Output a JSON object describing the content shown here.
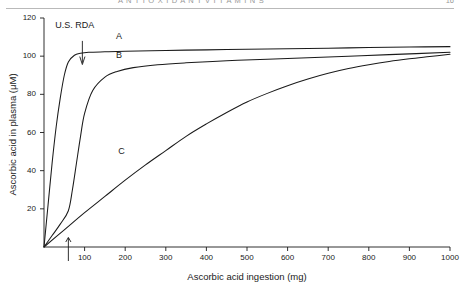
{
  "page": {
    "running_head": "A N T I O X I D A N T   V I T A M I N S",
    "folio": "16"
  },
  "figure": {
    "annotation_rda": "U.S. RDA",
    "curve_label_a": "A",
    "curve_label_b": "B",
    "curve_label_c": "C",
    "rda_arrow_top_icon": "down-arrow-icon",
    "rda_arrow_bottom_icon": "up-arrow-icon",
    "ink_color": "#1a1a1a"
  },
  "chart_data": {
    "type": "line",
    "title": "",
    "xlabel": "Ascorbic acid ingestion (mg)",
    "ylabel": "Ascorbic acid in plasma (μM)",
    "xlim": [
      0,
      1000
    ],
    "ylim": [
      0,
      120
    ],
    "xticks": [
      100,
      200,
      300,
      400,
      500,
      600,
      700,
      800,
      900,
      1000
    ],
    "yticks": [
      20,
      40,
      60,
      80,
      100,
      120
    ],
    "grid": false,
    "legend": "inline-curve-labels",
    "annotations": [
      {
        "text": "U.S. RDA",
        "x": 60,
        "y": 118,
        "arrow": "down-to-curve-a"
      },
      {
        "text": "",
        "x": 60,
        "y": 0,
        "arrow": "up-axis-marker"
      }
    ],
    "series": [
      {
        "name": "A",
        "label_x": 185,
        "label_y": 110,
        "x": [
          0,
          10,
          20,
          30,
          40,
          50,
          60,
          75,
          90,
          110,
          150,
          200,
          300,
          400,
          500,
          600,
          700,
          800,
          900,
          1000
        ],
        "y": [
          0,
          22,
          44,
          63,
          78,
          90,
          97,
          100.5,
          101.5,
          102,
          102.3,
          102.6,
          103,
          103.3,
          103.6,
          103.9,
          104.2,
          104.5,
          104.8,
          105
        ]
      },
      {
        "name": "B",
        "label_x": 185,
        "label_y": 100,
        "x": [
          0,
          20,
          40,
          60,
          70,
          80,
          90,
          100,
          120,
          150,
          180,
          220,
          280,
          350,
          450,
          550,
          650,
          750,
          850,
          1000
        ],
        "y": [
          0,
          6,
          12,
          19,
          30,
          44,
          58,
          70,
          82,
          89,
          92,
          94,
          95.5,
          96.5,
          97.6,
          98.4,
          99.2,
          100,
          100.8,
          102
        ]
      },
      {
        "name": "C",
        "label_x": 190,
        "label_y": 50,
        "x": [
          0,
          50,
          100,
          150,
          200,
          250,
          300,
          350,
          400,
          450,
          500,
          550,
          600,
          650,
          700,
          750,
          800,
          850,
          900,
          950,
          1000
        ],
        "y": [
          0,
          9,
          18,
          26.5,
          35,
          43,
          50.5,
          58,
          64.5,
          70.5,
          76,
          80.5,
          84.5,
          88,
          91,
          93.5,
          95.5,
          97.2,
          98.6,
          99.8,
          101
        ]
      }
    ]
  }
}
